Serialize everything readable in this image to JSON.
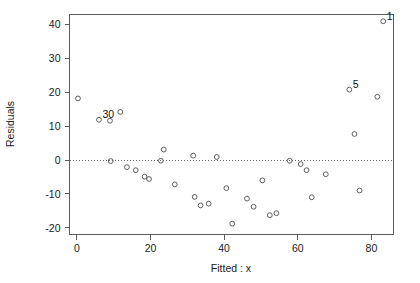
{
  "chart_data": {
    "type": "scatter",
    "title": "",
    "xlabel": "Fitted : x",
    "ylabel": "Residuals",
    "xlim": [
      -2,
      86
    ],
    "ylim": [
      -22,
      43
    ],
    "grid": false,
    "legend": null,
    "xticks": [
      0,
      20,
      40,
      60,
      80
    ],
    "yticks": [
      -20,
      -10,
      0,
      10,
      20,
      30,
      40
    ],
    "xtick_labels": [
      "0",
      "20",
      "40",
      "60",
      "80"
    ],
    "ytick_labels": [
      "-20",
      "-10",
      "0",
      "10",
      "20",
      "30",
      "40"
    ],
    "reference_lines": [
      {
        "orientation": "horizontal",
        "value": 0,
        "style": "dotted"
      }
    ],
    "points": [
      {
        "x": 0.3,
        "y": 18.2,
        "label": null
      },
      {
        "x": 6.0,
        "y": 11.9,
        "label": "30"
      },
      {
        "x": 9.0,
        "y": 11.6,
        "label": null
      },
      {
        "x": 11.8,
        "y": 14.2,
        "label": null
      },
      {
        "x": 9.2,
        "y": -0.3,
        "label": null
      },
      {
        "x": 13.6,
        "y": -2.1,
        "label": null
      },
      {
        "x": 16.0,
        "y": -3.0,
        "label": null
      },
      {
        "x": 18.4,
        "y": -4.9,
        "label": null
      },
      {
        "x": 19.6,
        "y": -5.6,
        "label": null
      },
      {
        "x": 22.8,
        "y": -0.2,
        "label": null
      },
      {
        "x": 23.6,
        "y": 3.1,
        "label": null
      },
      {
        "x": 26.6,
        "y": -7.2,
        "label": null
      },
      {
        "x": 31.6,
        "y": 1.3,
        "label": null
      },
      {
        "x": 32.0,
        "y": -10.9,
        "label": null
      },
      {
        "x": 33.6,
        "y": -13.4,
        "label": null
      },
      {
        "x": 35.8,
        "y": -12.9,
        "label": null
      },
      {
        "x": 38.0,
        "y": 0.9,
        "label": null
      },
      {
        "x": 40.6,
        "y": -8.3,
        "label": null
      },
      {
        "x": 42.2,
        "y": -18.8,
        "label": null
      },
      {
        "x": 46.2,
        "y": -11.4,
        "label": null
      },
      {
        "x": 48.0,
        "y": -13.8,
        "label": null
      },
      {
        "x": 50.4,
        "y": -6.0,
        "label": null
      },
      {
        "x": 52.4,
        "y": -16.3,
        "label": null
      },
      {
        "x": 54.2,
        "y": -15.7,
        "label": null
      },
      {
        "x": 57.8,
        "y": -0.2,
        "label": null
      },
      {
        "x": 60.8,
        "y": -1.2,
        "label": null
      },
      {
        "x": 62.4,
        "y": -3.0,
        "label": null
      },
      {
        "x": 63.8,
        "y": -11.0,
        "label": null
      },
      {
        "x": 67.6,
        "y": -4.2,
        "label": null
      },
      {
        "x": 74.0,
        "y": 20.8,
        "label": "5"
      },
      {
        "x": 75.4,
        "y": 7.7,
        "label": null
      },
      {
        "x": 76.8,
        "y": -9.0,
        "label": null
      },
      {
        "x": 81.6,
        "y": 18.7,
        "label": null
      },
      {
        "x": 83.2,
        "y": 41.0,
        "label": "1"
      }
    ]
  },
  "axes": {
    "y_title": "Residuals",
    "x_title": "Fitted : x"
  }
}
